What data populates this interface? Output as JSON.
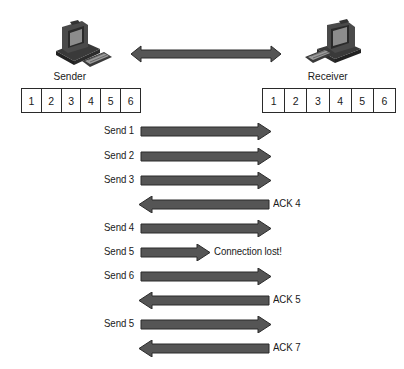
{
  "diagram": {
    "sender": {
      "label": "Sender",
      "icon": "computer-icon",
      "buffer": [
        "1",
        "2",
        "3",
        "4",
        "5",
        "6"
      ]
    },
    "receiver": {
      "label": "Receiver",
      "icon": "computer-icon",
      "buffer": [
        "1",
        "2",
        "3",
        "4",
        "5",
        "6"
      ]
    },
    "link": {
      "type": "bidirectional-arrow"
    },
    "exchanges": [
      {
        "label": "Send 1",
        "direction": "right",
        "complete": true
      },
      {
        "label": "Send 2",
        "direction": "right",
        "complete": true
      },
      {
        "label": "Send 3",
        "direction": "right",
        "complete": true
      },
      {
        "label": "ACK 4",
        "direction": "left",
        "complete": true
      },
      {
        "label": "Send 4",
        "direction": "right",
        "complete": true
      },
      {
        "label": "Send 5",
        "direction": "right",
        "complete": false,
        "note": "Connection lost!"
      },
      {
        "label": "Send 6",
        "direction": "right",
        "complete": true
      },
      {
        "label": "ACK 5",
        "direction": "left",
        "complete": true
      },
      {
        "label": "Send 5",
        "direction": "right",
        "complete": true
      },
      {
        "label": "ACK 7",
        "direction": "left",
        "complete": true
      }
    ],
    "colors": {
      "arrow_fill": "#555555",
      "arrow_stroke": "#2b2b2b",
      "background": "#ffffff",
      "text": "#1a1a1a"
    }
  }
}
